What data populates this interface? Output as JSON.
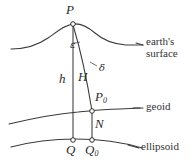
{
  "figure": {
    "name": "geodetic-height-diagram",
    "background_color": "#ffffff",
    "line_color": "#3a3a3a",
    "text_color": "#2b2b2b"
  },
  "points": {
    "P": {
      "label": "P",
      "x": 73,
      "y": 24,
      "description": "point on earth's surface"
    },
    "P0": {
      "label": "P",
      "subscript": "0",
      "x": 92,
      "y": 111,
      "description": "point on geoid"
    },
    "Q": {
      "label": "Q",
      "x": 73,
      "y": 140,
      "description": "ellipsoidal foot of normal"
    },
    "Q0": {
      "label": "Q",
      "subscript": "0",
      "x": 92,
      "y": 140,
      "description": "ellipsoidal foot of plumb line"
    }
  },
  "measurements": {
    "h": {
      "label": "h",
      "description": "ellipsoidal height P to Q"
    },
    "H": {
      "label": "H",
      "description": "orthometric height P to P0"
    },
    "N": {
      "label": "N",
      "description": "geoid undulation P0 to Q0"
    }
  },
  "angles": {
    "epsilon": {
      "label": "ε",
      "description": "deflection angle at P"
    },
    "delta": {
      "label": "δ",
      "description": "curvature of plumb line"
    }
  },
  "surfaces": [
    {
      "id": "earth-surface",
      "label": "earth's\nsurface",
      "line1": "earth's",
      "line2": "surface"
    },
    {
      "id": "geoid",
      "label": "geoid"
    },
    {
      "id": "ellipsoid",
      "label": "ellipsoid"
    }
  ],
  "leaders": {
    "earth_surface_visible": true,
    "geoid_visible": true,
    "ellipsoid_visible": true
  }
}
